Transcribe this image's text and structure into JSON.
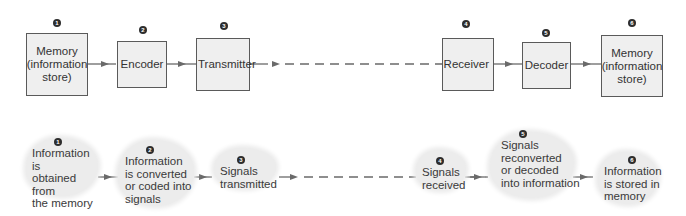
{
  "top_row": {
    "nodes": [
      {
        "number": "1",
        "label": "Memory (information store)",
        "lines": [
          "Memory",
          "(information",
          "store)"
        ]
      },
      {
        "number": "2",
        "label": "Encoder",
        "lines": [
          "Encoder"
        ]
      },
      {
        "number": "3",
        "label": "Transmitter",
        "lines": [
          "Transmitter"
        ]
      },
      {
        "number": "4",
        "label": "Receiver",
        "lines": [
          "Receiver"
        ]
      },
      {
        "number": "5",
        "label": "Decoder",
        "lines": [
          "Decoder"
        ]
      },
      {
        "number": "6",
        "label": "Memory (information store)",
        "lines": [
          "Memory",
          "(information",
          "store)"
        ]
      }
    ]
  },
  "bottom_row": {
    "nodes": [
      {
        "number": "1",
        "lines": [
          "Information is",
          "obtained from",
          "the memory"
        ]
      },
      {
        "number": "2",
        "lines": [
          "Information",
          "is converted",
          "or coded into",
          "signals"
        ]
      },
      {
        "number": "3",
        "lines": [
          "Signals",
          "transmitted"
        ]
      },
      {
        "number": "4",
        "lines": [
          "Signals",
          "received"
        ]
      },
      {
        "number": "5",
        "lines": [
          "Signals",
          "reconverted",
          "or decoded",
          "into information"
        ]
      },
      {
        "number": "6",
        "lines": [
          "Information",
          "is stored in",
          "memory"
        ]
      }
    ]
  },
  "colors": {
    "box_fill": "#efefef",
    "box_border": "#5a5a5a",
    "arrow": "#6a6a6a",
    "cloud_fill": "#ececec",
    "marker": "#2d2d2d"
  }
}
